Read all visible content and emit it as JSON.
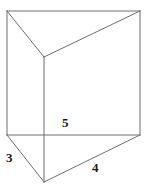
{
  "figure": {
    "name": "triangular-prism",
    "background_color": "#ffffff",
    "stroke_color": "#6e6e6e",
    "stroke_width": 1,
    "label_color": "#1a1a1a",
    "canvas": {
      "width": 150,
      "height": 192
    },
    "vertices": {
      "top_back_left": [
        7,
        11
      ],
      "top_back_right": [
        140,
        11
      ],
      "top_front": [
        44,
        57
      ],
      "bottom_back_left": [
        7,
        135
      ],
      "bottom_back_right": [
        140,
        135
      ],
      "bottom_front": [
        44,
        182
      ]
    },
    "edges": [
      {
        "name": "top-back-edge",
        "from": [
          7,
          11
        ],
        "to": [
          140,
          11
        ]
      },
      {
        "name": "top-left-edge",
        "from": [
          7,
          11
        ],
        "to": [
          44,
          57
        ]
      },
      {
        "name": "top-right-edge",
        "from": [
          44,
          57
        ],
        "to": [
          140,
          11
        ]
      },
      {
        "name": "left-vertical-edge",
        "from": [
          7,
          11
        ],
        "to": [
          7,
          135
        ]
      },
      {
        "name": "right-vertical-edge",
        "from": [
          140,
          11
        ],
        "to": [
          140,
          135
        ]
      },
      {
        "name": "front-vertical-edge",
        "from": [
          44,
          57
        ],
        "to": [
          44,
          182
        ]
      },
      {
        "name": "bottom-back-edge",
        "from": [
          7,
          135
        ],
        "to": [
          140,
          135
        ]
      },
      {
        "name": "bottom-left-edge",
        "from": [
          7,
          135
        ],
        "to": [
          44,
          182
        ]
      },
      {
        "name": "bottom-right-edge",
        "from": [
          44,
          182
        ],
        "to": [
          140,
          135
        ]
      }
    ],
    "labels": {
      "left_base": "3",
      "right_base": "4",
      "height": "5"
    }
  }
}
